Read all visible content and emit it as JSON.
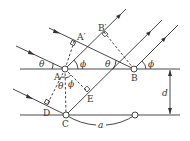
{
  "diagram": {
    "labels": {
      "A": "A",
      "A_prime": "A′",
      "B": "B",
      "B_prime": "B′",
      "C": "C",
      "D": "D",
      "E": "E",
      "theta": "θ",
      "phi": "ϕ",
      "d": "d",
      "a": "a"
    }
  }
}
